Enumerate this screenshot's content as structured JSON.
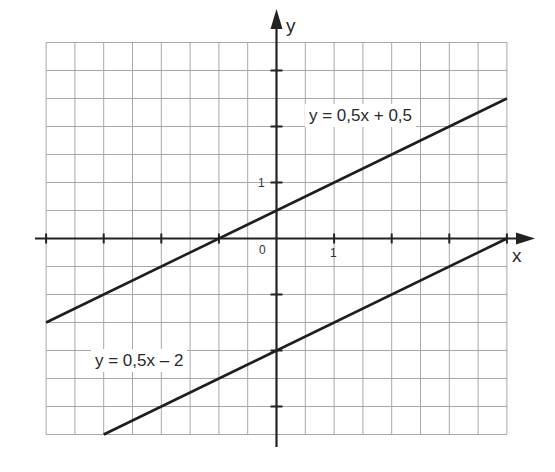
{
  "chart_data": {
    "type": "line",
    "title": "",
    "xlabel": "x",
    "ylabel": "y",
    "xlim": [
      -4,
      4
    ],
    "ylim": [
      -3.5,
      3.5
    ],
    "grid": true,
    "grid_step": 0.5,
    "x_ticks": [
      -4,
      -3,
      -2,
      -1,
      1,
      2,
      3,
      4
    ],
    "y_ticks": [
      -3,
      -2,
      -1,
      1,
      2,
      3
    ],
    "tick_labels": {
      "origin": "0",
      "x_one": "1",
      "y_one": "1"
    },
    "series": [
      {
        "name": "y = 0,5x + 0,5",
        "slope": 0.5,
        "intercept": 0.5,
        "x": [
          -4,
          4
        ],
        "y": [
          -1.5,
          2.5
        ]
      },
      {
        "name": "y = 0,5x – 2",
        "slope": 0.5,
        "intercept": -2,
        "x": [
          -3,
          4
        ],
        "y": [
          -3.5,
          0
        ]
      }
    ],
    "annotations": [
      {
        "text": "y = 0,5x + 0,5",
        "series": 0
      },
      {
        "text": "y = 0,5x – 2",
        "series": 1
      }
    ]
  },
  "labels": {
    "x_axis": "x",
    "y_axis": "y",
    "origin": "0",
    "x_one": "1",
    "y_one": "1",
    "line1": "y = 0,5x + 0,5",
    "line2": "y = 0,5x – 2"
  },
  "colors": {
    "grid": "#a8a8a8",
    "axis": "#222222",
    "line": "#1e1e1e"
  }
}
